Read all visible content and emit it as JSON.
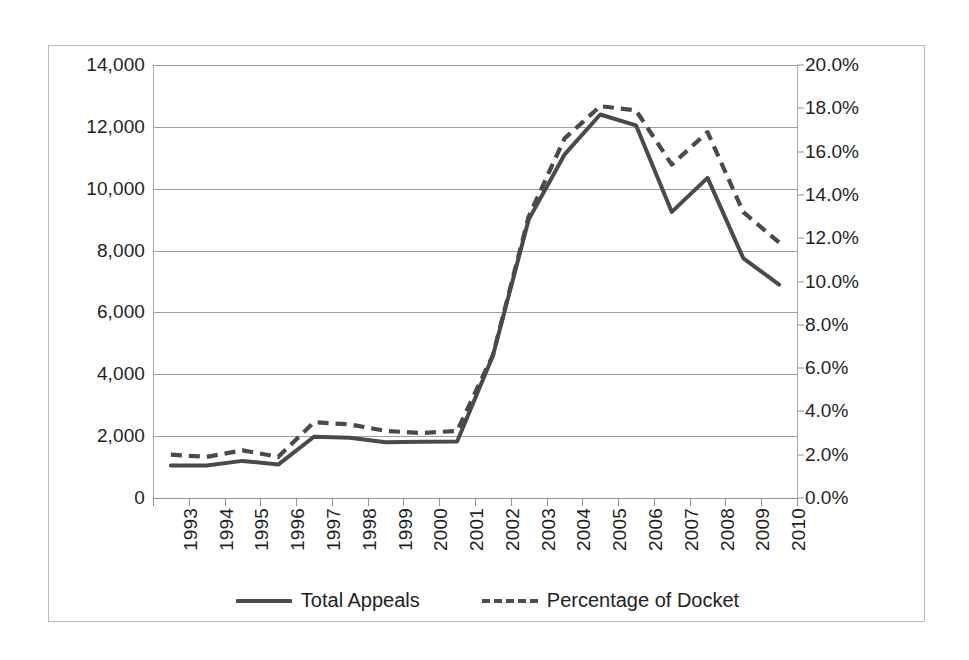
{
  "chart_data": {
    "type": "line",
    "title": "",
    "subtitle": "",
    "xlabel": "",
    "ylabel": "",
    "grid": true,
    "legend_position": "bottom",
    "categories": [
      "1993",
      "1994",
      "1995",
      "1996",
      "1997",
      "1998",
      "1999",
      "2000",
      "2001",
      "2002",
      "2003",
      "2004",
      "2005",
      "2006",
      "2007",
      "2008",
      "2009",
      "2010"
    ],
    "axes": {
      "left": {
        "label": "",
        "ylim": [
          0,
          14000
        ],
        "tick_step": 2000,
        "ticks": [
          "0",
          "2,000",
          "4,000",
          "6,000",
          "8,000",
          "10,000",
          "12,000",
          "14,000"
        ],
        "tick_values": [
          0,
          2000,
          4000,
          6000,
          8000,
          10000,
          12000,
          14000
        ]
      },
      "right": {
        "label": "",
        "ylim": [
          0,
          20
        ],
        "tick_step": 2,
        "ticks": [
          "0.0%",
          "2.0%",
          "4.0%",
          "6.0%",
          "8.0%",
          "10.0%",
          "12.0%",
          "14.0%",
          "16.0%",
          "18.0%",
          "20.0%"
        ],
        "tick_values": [
          0,
          2,
          4,
          6,
          8,
          10,
          12,
          14,
          16,
          18,
          20
        ]
      }
    },
    "series": [
      {
        "name": "Total Appeals",
        "axis": "left",
        "style": "solid",
        "color": "#4a4a4a",
        "values": [
          1050,
          1050,
          1200,
          1080,
          1980,
          1950,
          1800,
          1820,
          1830,
          4600,
          9000,
          11100,
          12400,
          12050,
          9250,
          10350,
          7750,
          6900
        ]
      },
      {
        "name": "Percentage of Docket",
        "axis": "right",
        "style": "dashed",
        "color": "#4a4a4a",
        "values": [
          2.0,
          1.9,
          2.2,
          1.9,
          3.5,
          3.4,
          3.1,
          3.0,
          3.1,
          6.6,
          13.0,
          16.6,
          18.1,
          17.9,
          15.4,
          16.9,
          13.2,
          11.8
        ]
      }
    ]
  },
  "legend": {
    "entries": [
      {
        "label": "Total Appeals",
        "style": "solid"
      },
      {
        "label": "Percentage of Docket",
        "style": "dashed"
      }
    ]
  }
}
